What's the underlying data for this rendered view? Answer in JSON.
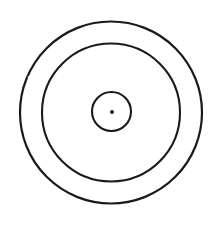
{
  "figure": {
    "name": "concentric-circles-target",
    "background_color": "#ffffff",
    "stroke_color": "#1a1a1a",
    "width": 220,
    "height": 229
  },
  "geometry": {
    "center": {
      "x": 111,
      "y": 112.5
    },
    "rings": [
      {
        "id": "outer-ring",
        "label": "Outer circle",
        "cx": 111,
        "cy": 112.5,
        "r": 91,
        "stroke_width": 2.2,
        "stroke_color": "#1a1a1a",
        "fill": "none"
      },
      {
        "id": "middle-ring",
        "label": "Middle circle",
        "cx": 111,
        "cy": 112.5,
        "r": 69,
        "stroke_width": 2.1,
        "stroke_color": "#1a1a1a",
        "fill": "none"
      },
      {
        "id": "inner-ring",
        "label": "Inner circle",
        "cx": 111.5,
        "cy": 111.5,
        "r": 19.5,
        "stroke_width": 2.1,
        "stroke_color": "#1a1a1a",
        "fill": "none"
      }
    ],
    "center_dot": {
      "id": "bullseye-dot",
      "label": "Center dot",
      "cx": 112,
      "cy": 112,
      "r": 1.9,
      "fill": "#1a1a1a"
    },
    "artifacts": [
      {
        "id": "speck",
        "label": "Faint speck",
        "cx": 28.5,
        "cy": 77,
        "r": 0.9,
        "fill": "#d8d8d8"
      }
    ]
  }
}
